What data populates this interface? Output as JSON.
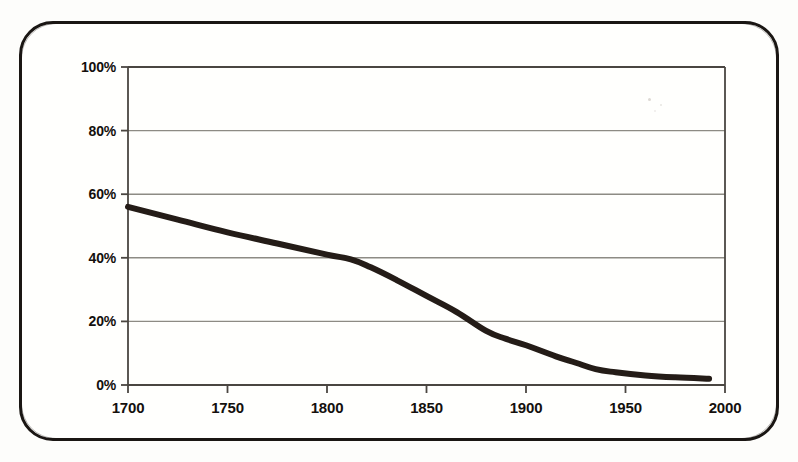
{
  "figure": {
    "kind": "scanned-line-chart",
    "border_color": "#1a1613",
    "background_color": "#fffffd",
    "line_color": "#241c17",
    "grid_color": "#8d8b84",
    "axis_color": "#4a4641",
    "text_color": "#14100d"
  },
  "chart_data": {
    "type": "line",
    "title": "",
    "subtitle": "",
    "xlabel": "",
    "ylabel": "",
    "xlim": [
      1700,
      2000
    ],
    "ylim": [
      0,
      100
    ],
    "grid": "horizontal",
    "legend": "none",
    "annotations": [],
    "y_tick_labels": [
      "0%",
      "20%",
      "40%",
      "60%",
      "80%",
      "100%"
    ],
    "y_tick_values": [
      0,
      20,
      40,
      60,
      80,
      100
    ],
    "x_tick_labels": [
      "1700",
      "1750",
      "1800",
      "1850",
      "1900",
      "1950",
      "2000"
    ],
    "x_tick_values": [
      1700,
      1750,
      1800,
      1850,
      1900,
      1950,
      2000
    ],
    "y_unit": "percent",
    "series": [
      {
        "name": "share",
        "color": "#241c17",
        "line_width": 6,
        "x": [
          1700,
          1725,
          1750,
          1775,
          1800,
          1812,
          1822,
          1835,
          1850,
          1865,
          1880,
          1890,
          1900,
          1915,
          1925,
          1935,
          1945,
          1960,
          1975,
          1992
        ],
        "values": [
          56,
          52,
          48,
          44.5,
          41,
          39.5,
          37,
          33,
          28,
          23,
          17,
          14.5,
          12.5,
          9,
          7,
          5,
          4,
          3,
          2.4,
          2
        ]
      }
    ]
  }
}
